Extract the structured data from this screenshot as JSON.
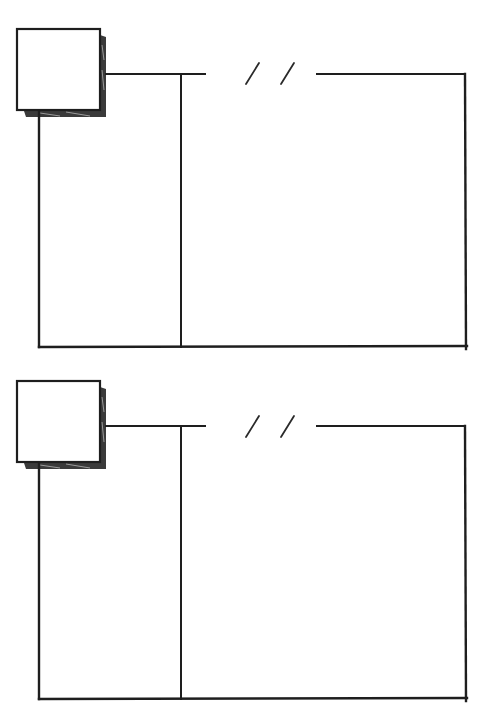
{
  "diagram": {
    "style": "hand-drawn sketch",
    "ink_color": "#1e1e1e",
    "shadow_color": "#3a3a3a",
    "background": "#ffffff",
    "panels": [
      {
        "id": "panel-1",
        "top": 0,
        "elements": [
          "shaded-box",
          "top-connector-line",
          "break-marker-double-slash",
          "outer-frame",
          "column-divider"
        ]
      },
      {
        "id": "panel-2",
        "top": 352,
        "elements": [
          "shaded-box",
          "top-connector-line",
          "break-marker-double-slash",
          "outer-frame",
          "column-divider"
        ]
      }
    ],
    "break_marker": "/ /"
  }
}
